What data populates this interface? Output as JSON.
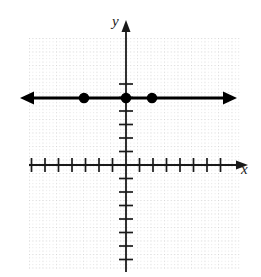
{
  "figure": {
    "kind": "coordinate-plane-graph",
    "width": 261,
    "height": 277,
    "background_color": "#ffffff"
  },
  "axes": {
    "x_label": "x",
    "y_label": "y",
    "origin": {
      "x": 126,
      "y": 165
    },
    "axis_color": "#1a1a1a",
    "x_axis": {
      "name": "x-axis",
      "y": 165,
      "x_start": 29,
      "x_end": 248,
      "arrow": "right",
      "tick_spacing": 13.5,
      "ticks_left": 7,
      "ticks_right": 7,
      "tick_half_length": 7
    },
    "y_axis": {
      "name": "y-axis",
      "x": 126,
      "y_start": 20,
      "y_end": 272,
      "arrow": "up",
      "tick_spacing": 13.5,
      "ticks_above": 6,
      "ticks_below": 7,
      "tick_half_length": 7
    }
  },
  "grid": {
    "color": "#d8d8d8",
    "spacing": 13.5,
    "left": 29,
    "top": 38,
    "right": 240,
    "bottom": 270,
    "style": "dotted"
  },
  "chart_data": {
    "type": "line",
    "title": "",
    "xlabel": "x",
    "ylabel": "y",
    "grid": true,
    "legend": "none",
    "xlim": [
      -7,
      7
    ],
    "ylim": [
      -7,
      6
    ],
    "series": [
      {
        "name": "horizontal line y = 5",
        "equation": "y = 5",
        "kind": "ray-both-directions",
        "x": [
          -7.2,
          7.2
        ],
        "y": [
          5,
          5
        ],
        "arrows": "both",
        "color": "#000000",
        "pixel_y": 98,
        "pixel_x_start": 20,
        "pixel_x_end": 237
      }
    ],
    "points": [
      {
        "label": "(-3, 5)",
        "x": -3,
        "y": 5,
        "filled": true,
        "pixel_x": 84,
        "pixel_y": 98
      },
      {
        "label": "(0, 5)",
        "x": 0,
        "y": 5,
        "filled": true,
        "pixel_x": 126,
        "pixel_y": 98
      },
      {
        "label": "(2, 5)",
        "x": 2,
        "y": 5,
        "filled": true,
        "pixel_x": 152,
        "pixel_y": 98
      }
    ],
    "point_color": "#000000",
    "point_radius": 4.5
  }
}
